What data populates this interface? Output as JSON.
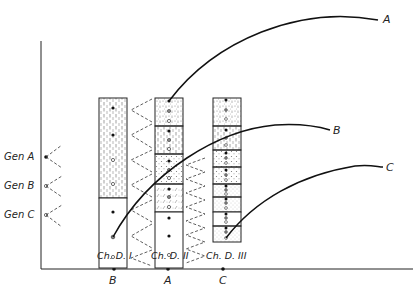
{
  "diagram": {
    "type": "chromosome-column lineage diagram",
    "gene_labels": [
      "Gen A",
      "Gen B",
      "Gen C"
    ],
    "columns": [
      {
        "label": "Ch. D. I",
        "axis_letter": "B"
      },
      {
        "label": "Ch. D. II",
        "axis_letter": "A"
      },
      {
        "label": "Ch. D. III",
        "axis_letter": "C"
      }
    ],
    "curve_labels": {
      "a": "A",
      "b": "B",
      "c": "C"
    }
  }
}
